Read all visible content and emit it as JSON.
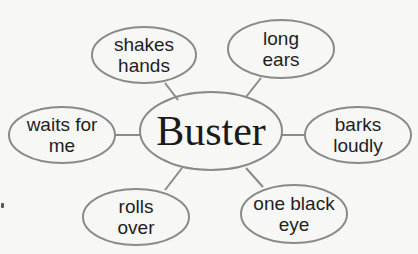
{
  "diagram": {
    "type": "word web",
    "colors": {
      "outline": "#8a8a8a",
      "text": "#1e1e1e",
      "background": "#f7f7f5"
    },
    "center": {
      "label": "Buster",
      "cx": 211,
      "cy": 131,
      "rx": 71,
      "ry": 39
    },
    "nodes": [
      {
        "id": "shakes-hands",
        "line1": "shakes",
        "line2": "hands",
        "cx": 144,
        "cy": 55,
        "rx": 52,
        "ry": 28
      },
      {
        "id": "long-ears",
        "line1": "long",
        "line2": "ears",
        "cx": 281,
        "cy": 49,
        "rx": 53,
        "ry": 29
      },
      {
        "id": "waits-for-me",
        "line1": "waits for",
        "line2": "me",
        "cx": 62,
        "cy": 135,
        "rx": 53,
        "ry": 28
      },
      {
        "id": "barks-loudly",
        "line1": "barks",
        "line2": "loudly",
        "cx": 358,
        "cy": 135,
        "rx": 53,
        "ry": 28
      },
      {
        "id": "rolls-over",
        "line1": "rolls",
        "line2": "over",
        "cx": 136,
        "cy": 217,
        "rx": 53,
        "ry": 28
      },
      {
        "id": "one-black-eye",
        "line1": "one black",
        "line2": "eye",
        "cx": 294,
        "cy": 214,
        "rx": 53,
        "ry": 29
      }
    ],
    "connectors": [
      {
        "to": "shakes-hands",
        "x1": 165,
        "y1": 83,
        "x2": 178,
        "y2": 100
      },
      {
        "to": "long-ears",
        "x1": 261,
        "y1": 78,
        "x2": 246,
        "y2": 97
      },
      {
        "to": "waits-for-me",
        "x1": 115,
        "y1": 135,
        "x2": 141,
        "y2": 135
      },
      {
        "to": "barks-loudly",
        "x1": 282,
        "y1": 135,
        "x2": 305,
        "y2": 135
      },
      {
        "to": "rolls-over",
        "x1": 165,
        "y1": 190,
        "x2": 182,
        "y2": 168
      },
      {
        "to": "one-black-eye",
        "x1": 263,
        "y1": 187,
        "x2": 246,
        "y2": 168
      }
    ]
  }
}
